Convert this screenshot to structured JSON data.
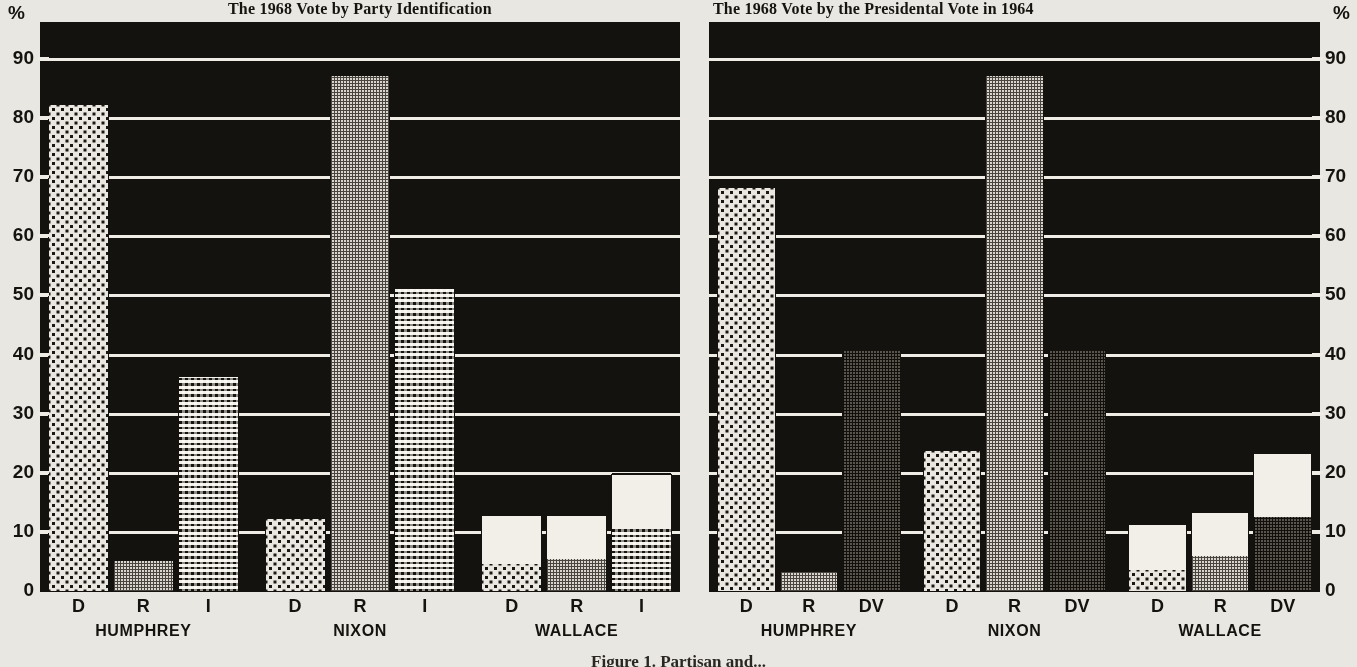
{
  "axis": {
    "unit_symbol": "%",
    "ticks": [
      90,
      80,
      70,
      60,
      50,
      40,
      30,
      20,
      10,
      0
    ],
    "min": 0,
    "max": 95
  },
  "caption": "Figure 1. Partisan and...",
  "charts": [
    {
      "id": "left",
      "title": "The 1968 Vote by Party Identification",
      "group_key": "Party Identification",
      "subcategories": [
        "D",
        "R",
        "I"
      ],
      "groups": [
        {
          "name": "HUMPHREY",
          "bars": [
            {
              "label": "D",
              "pattern": "dots",
              "value": 82.5,
              "white_top": null
            },
            {
              "label": "R",
              "pattern": "grid",
              "value": 5.5,
              "white_top": null
            },
            {
              "label": "I",
              "pattern": "wave",
              "value": 36.5,
              "white_top": null
            }
          ]
        },
        {
          "name": "NIXON",
          "bars": [
            {
              "label": "D",
              "pattern": "dots",
              "value": 12.5,
              "white_top": null
            },
            {
              "label": "R",
              "pattern": "grid",
              "value": 87.5,
              "white_top": null
            },
            {
              "label": "I",
              "pattern": "wave",
              "value": 51.5,
              "white_top": null
            }
          ]
        },
        {
          "name": "WALLACE",
          "bars": [
            {
              "label": "D",
              "pattern": "dots",
              "value": 4.5,
              "white_top": 13.0
            },
            {
              "label": "R",
              "pattern": "grid",
              "value": 5.5,
              "white_top": 13.0
            },
            {
              "label": "I",
              "pattern": "wave",
              "value": 10.5,
              "white_top": 20.0
            }
          ]
        }
      ]
    },
    {
      "id": "right",
      "title": "The 1968 Vote by the Presidental Vote in 1964",
      "group_key": "Presidential Vote in 1964",
      "subcategories": [
        "D",
        "R",
        "DV"
      ],
      "groups": [
        {
          "name": "HUMPHREY",
          "bars": [
            {
              "label": "D",
              "pattern": "dots",
              "value": 68.5,
              "white_top": null
            },
            {
              "label": "R",
              "pattern": "grid",
              "value": 3.5,
              "white_top": null
            },
            {
              "label": "DV",
              "pattern": "dark",
              "value": 41.0,
              "white_top": null
            }
          ]
        },
        {
          "name": "NIXON",
          "bars": [
            {
              "label": "D",
              "pattern": "dots",
              "value": 24.0,
              "white_top": null
            },
            {
              "label": "R",
              "pattern": "grid",
              "value": 87.5,
              "white_top": null
            },
            {
              "label": "DV",
              "pattern": "dark",
              "value": 41.0,
              "white_top": null
            }
          ]
        },
        {
          "name": "WALLACE",
          "bars": [
            {
              "label": "D",
              "pattern": "dots",
              "value": 3.5,
              "white_top": 11.5
            },
            {
              "label": "R",
              "pattern": "grid",
              "value": 6.0,
              "white_top": 13.5
            },
            {
              "label": "DV",
              "pattern": "dark",
              "value": 12.5,
              "white_top": 23.5
            }
          ]
        }
      ]
    }
  ],
  "chart_data": {
    "type": "bar",
    "xlabel": "",
    "ylabel": "%",
    "ylim": [
      0,
      95
    ],
    "yticks": [
      0,
      10,
      20,
      30,
      40,
      50,
      60,
      70,
      80,
      90
    ],
    "grid": true,
    "legend": "none",
    "panels": [
      {
        "title": "The 1968 Vote by Party Identification",
        "categories": [
          "HUMPHREY",
          "NIXON",
          "WALLACE"
        ],
        "subcategories": [
          "D",
          "R",
          "I"
        ],
        "series": [
          {
            "name": "D (Democrat identifier)",
            "values": [
              82.5,
              12.5,
              13.0
            ]
          },
          {
            "name": "R (Republican identifier)",
            "values": [
              5.5,
              87.5,
              13.0
            ]
          },
          {
            "name": "I (Independent)",
            "values": [
              36.5,
              51.5,
              20.0
            ]
          }
        ],
        "note": "Wallace bars are drawn as two-tone bars: shaded lower portion D=4.5, R=5.5, I=10.5 with white upper portion up to the total."
      },
      {
        "title": "The 1968 Vote by the Presidental Vote in 1964",
        "categories": [
          "HUMPHREY",
          "NIXON",
          "WALLACE"
        ],
        "subcategories": [
          "D",
          "R",
          "DV"
        ],
        "series": [
          {
            "name": "D (voted Johnson 1964)",
            "values": [
              68.5,
              24.0,
              11.5
            ]
          },
          {
            "name": "R (voted Goldwater 1964)",
            "values": [
              3.5,
              87.5,
              13.5
            ]
          },
          {
            "name": "DV (did not vote 1964)",
            "values": [
              41.0,
              41.0,
              23.5
            ]
          }
        ],
        "note": "Wallace bars are drawn as two-tone bars: shaded lower portion D=3.5, R=6.0, DV=12.5 with white upper portion up to the total."
      }
    ]
  }
}
